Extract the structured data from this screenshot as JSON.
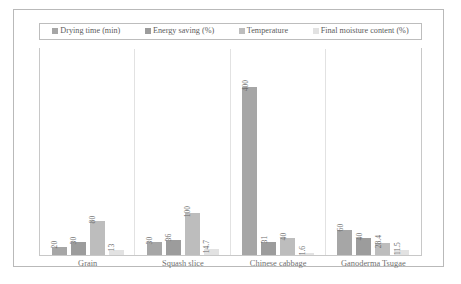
{
  "chart_data": {
    "type": "bar",
    "title": "",
    "subtitle": "",
    "xlabel": "",
    "ylabel": "",
    "ylim": [
      0,
      420
    ],
    "grid": false,
    "legend_position": "top",
    "categories": [
      "Grain",
      "Squash slice",
      "Chinese cabbage",
      "Ganoderma Tsugae"
    ],
    "series": [
      {
        "name": "Drying time (min)",
        "color": "#a6a6a6",
        "values": [
          20,
          30,
          400,
          60
        ],
        "labels": [
          "20",
          "30",
          "400",
          "60"
        ]
      },
      {
        "name": "Energy saving (%)",
        "color": "#9c9c9c",
        "values": [
          30,
          36,
          31,
          40
        ],
        "labels": [
          "30",
          "36",
          "31",
          "40"
        ]
      },
      {
        "name": "Temperature",
        "color": "#bdbdbd",
        "values": [
          80,
          100,
          40,
          28.4
        ],
        "labels": [
          "80",
          "100",
          "40",
          "28.4"
        ]
      },
      {
        "name": "Final moisture content (%)",
        "color": "#e2e2e2",
        "values": [
          13,
          14.7,
          1.6,
          11.5
        ],
        "labels": [
          "13",
          "14.7",
          "1.6",
          "11.5"
        ]
      }
    ]
  },
  "legend": {
    "items": [
      {
        "label": "Drying time (min)",
        "color": "#a6a6a6"
      },
      {
        "label": "Energy saving (%)",
        "color": "#9c9c9c"
      },
      {
        "label": "Temperature",
        "color": "#bdbdbd"
      },
      {
        "label": "Final moisture content (%)",
        "color": "#e2e2e2"
      }
    ]
  }
}
